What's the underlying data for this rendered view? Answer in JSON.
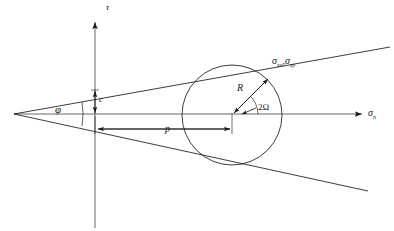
{
  "figure": {
    "stroke_color": "#1a1a1a",
    "background_color": "#ffffff"
  },
  "axes": {
    "vertical_label": "τ",
    "horizontal_label_main": "σ",
    "horizontal_label_sub": "n"
  },
  "labels": {
    "cohesion": "c",
    "friction_angle": "φ",
    "mean_stress": "p",
    "radius": "R",
    "double_angle_main": "2",
    "double_angle_omega": "Ω",
    "stress_point_1_main": "σ",
    "stress_point_1_sub": "xx",
    "stress_point_comma": ",",
    "stress_point_2_main": "σ",
    "stress_point_2_sub": "xy"
  },
  "geometry": {
    "origin_x": 95,
    "origin_y": 114,
    "circle_center_x": 232,
    "circle_center_y": 115,
    "circle_radius": 50,
    "envelope_apex_x": 14,
    "envelope_apex_y": 114,
    "cohesion_intercept_y": 90,
    "friction_angle_degrees": 10
  }
}
